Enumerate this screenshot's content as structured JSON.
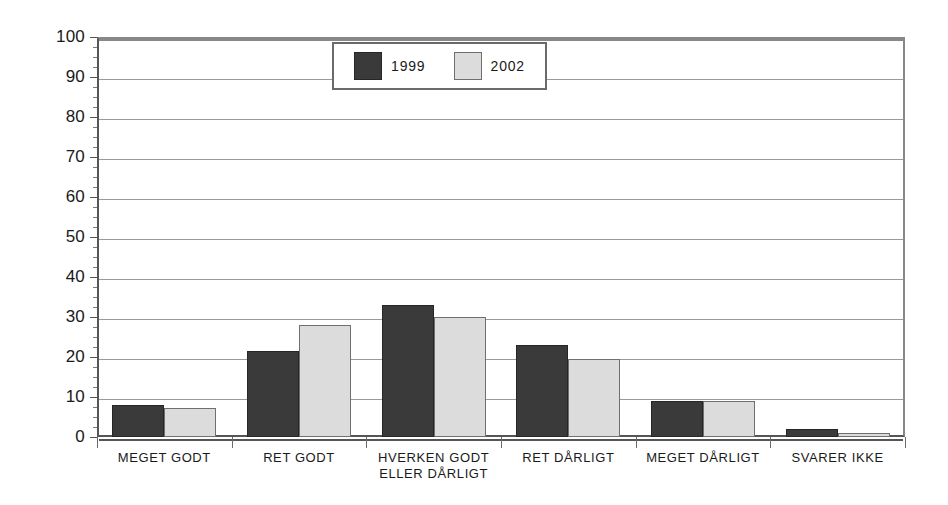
{
  "chart_data": {
    "type": "bar",
    "title": "",
    "subtitle": "",
    "xlabel": "",
    "ylabel": "",
    "ylim": [
      0,
      100
    ],
    "ytick_step": 10,
    "yticks": [
      0,
      10,
      20,
      30,
      40,
      50,
      60,
      70,
      80,
      90,
      100
    ],
    "ytick_labels": [
      "0",
      "10",
      "20",
      "30",
      "40",
      "50",
      "60",
      "70",
      "80",
      "90",
      "100"
    ],
    "minor_tick_step": 2.5,
    "grid": true,
    "grid_axis": "y",
    "legend_position": "top-center-inside",
    "categories": [
      "MEGET GODT",
      "RET GODT",
      "HVERKEN GODT\nELLER DÅRLIGT",
      "RET DÅRLIGT",
      "MEGET DÅRLIGT",
      "SVARER IKKE"
    ],
    "series": [
      {
        "name": "1999",
        "color": "#3a3a3a",
        "values": [
          8,
          21.5,
          33,
          23,
          9,
          2
        ]
      },
      {
        "name": "2002",
        "color": "#dcdcdc",
        "values": [
          7.3,
          28,
          30,
          19.5,
          9,
          1
        ]
      }
    ]
  },
  "legend": {
    "entries": [
      {
        "label": "1999",
        "swatch": "legend-swatch-1999"
      },
      {
        "label": "2002",
        "swatch": "legend-swatch-2002"
      }
    ]
  },
  "colors": {
    "series_1999": "#3a3a3a",
    "series_2002": "#dcdcdc",
    "gridline": "#9a9a9a",
    "axis": "#555555",
    "background": "#ffffff"
  }
}
